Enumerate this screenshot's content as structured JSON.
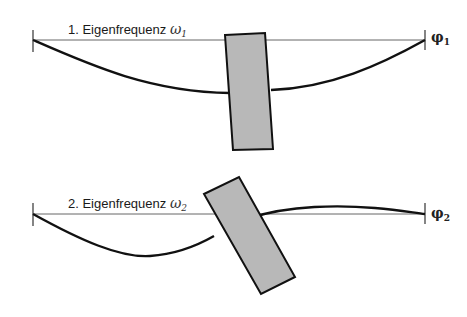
{
  "mode1": {
    "title": "1. Eigenfrequenz",
    "omega_symbol": "ω",
    "omega_index": "1",
    "end_symbol": "φ",
    "end_index": "1"
  },
  "mode2": {
    "title": "2. Eigenfrequenz",
    "omega_symbol": "ω",
    "omega_index": "2",
    "end_symbol": "φ",
    "end_index": "2"
  },
  "colors": {
    "line": "#111111",
    "reference_line": "#555555",
    "mass_fill": "#b8b8b8"
  }
}
